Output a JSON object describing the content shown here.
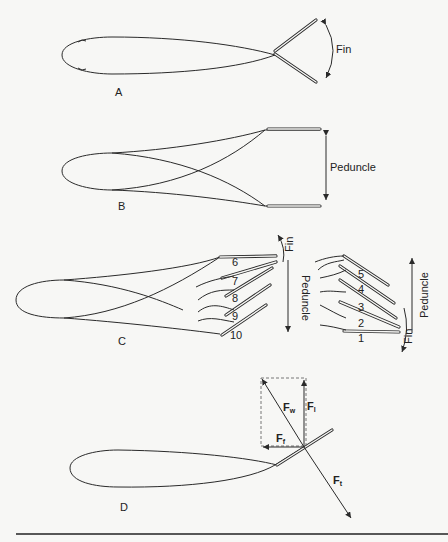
{
  "figure": {
    "panels": [
      {
        "id": "A",
        "label": "A",
        "annotation": "Fin"
      },
      {
        "id": "B",
        "label": "B",
        "annotation": "Peduncle"
      },
      {
        "id": "C",
        "label": "C",
        "annotations": {
          "left_fin": "Fin",
          "left_peduncle": "Peduncle",
          "right_peduncle": "Peduncle",
          "right_fin": "Fin"
        },
        "left_sequence": [
          "6",
          "7",
          "8",
          "9",
          "10"
        ],
        "right_sequence": [
          "5",
          "4",
          "3",
          "2",
          "1"
        ]
      },
      {
        "id": "D",
        "label": "D",
        "forces": {
          "w": {
            "main": "F",
            "sub": "w"
          },
          "l": {
            "main": "F",
            "sub": "l"
          },
          "f": {
            "main": "F",
            "sub": "f"
          },
          "t": {
            "main": "F",
            "sub": "t"
          }
        }
      }
    ]
  }
}
